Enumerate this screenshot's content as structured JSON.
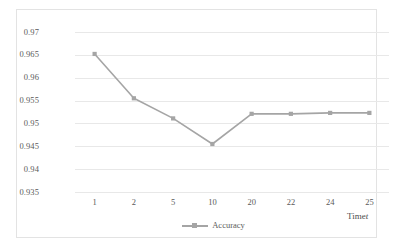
{
  "chart_data": {
    "type": "line",
    "title": "",
    "xlabel": "Time t",
    "ylabel": "",
    "categories": [
      "1",
      "2",
      "5",
      "10",
      "20",
      "22",
      "24",
      "25"
    ],
    "series": [
      {
        "name": "Accuracy",
        "values": [
          0.9652,
          0.9555,
          0.9511,
          0.9455,
          0.9521,
          0.9521,
          0.9523,
          0.9523
        ],
        "color": "#a5a5a5",
        "marker": "square"
      }
    ],
    "ylim": [
      0.935,
      0.97
    ],
    "ytick_labels": [
      "0.97",
      "0.965",
      "0.96",
      "0.955",
      "0.95",
      "0.945",
      "0.94",
      "0.935"
    ],
    "ytick_values": [
      0.97,
      0.965,
      0.96,
      0.955,
      0.95,
      0.945,
      0.94,
      0.935
    ],
    "grid": true,
    "grid_color": "#e8e8e8",
    "legend_position": "bottom",
    "legend_entries": [
      "Accuracy"
    ],
    "plot_background": "#ffffff",
    "border_color": "#e3e3e3"
  },
  "axis": {
    "x_title_main": "Time",
    "x_title_italic": "t"
  },
  "legend": {
    "accuracy_label": "Accuracy"
  }
}
